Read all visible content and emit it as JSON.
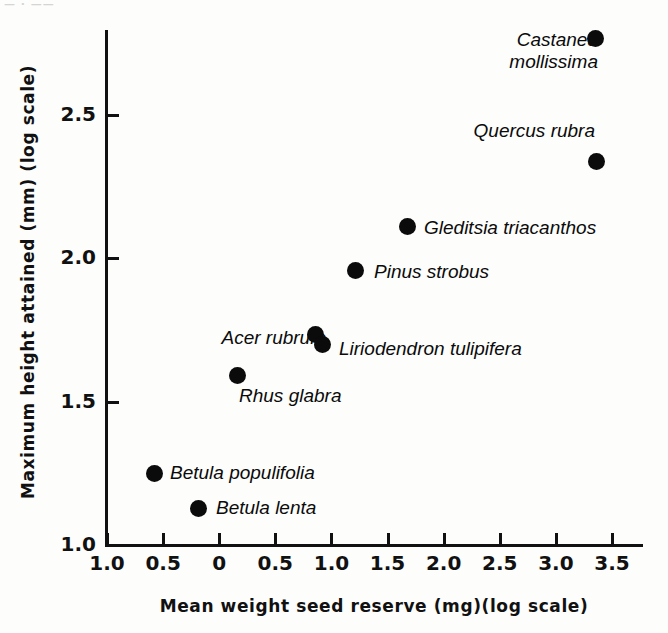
{
  "figure": {
    "page_header_remnant": "— · ——",
    "background_color": "#fdfdfc",
    "ink_color": "#0b0b0b"
  },
  "axes": {
    "y_title": "Maximum height attained (mm) (log scale)",
    "x_title": "Mean weight seed reserve (mg)(log scale)",
    "y_ticklabels": [
      "2.5",
      "2.0",
      "1.5",
      "1.0"
    ],
    "x_ticklabels": [
      "1.0",
      "0.5",
      "0",
      "0.5",
      "1.0",
      "1.5",
      "2.0",
      "2.5",
      "3.0",
      "3.5"
    ]
  },
  "chart_data": {
    "type": "scatter",
    "title": "",
    "xlabel": "Mean weight seed reserve (mg)(log scale)",
    "ylabel": "Maximum height attained (mm) (log scale)",
    "xlim": [
      -1.0,
      3.5
    ],
    "ylim": [
      1.0,
      2.81
    ],
    "xticks": [
      -1.0,
      -0.5,
      0,
      0.5,
      1.0,
      1.5,
      2.0,
      2.5,
      3.0,
      3.5
    ],
    "xticklabels": [
      "1.0",
      "0.5",
      "0",
      "0.5",
      "1.0",
      "1.5",
      "2.0",
      "2.5",
      "3.0",
      "3.5"
    ],
    "yticks": [
      1.0,
      1.5,
      2.0,
      2.5
    ],
    "yticklabels": [
      "1.0",
      "1.5",
      "2.0",
      "2.5"
    ],
    "grid": false,
    "legend": false,
    "marker": "filled-circle",
    "points": [
      {
        "label": "Castanea\nmollissima",
        "x": 3.36,
        "y": 2.78,
        "label_position": "left",
        "px": 595,
        "py": 38,
        "label_px": 458,
        "label_py": 29
      },
      {
        "label": "Quercus rubra",
        "x": 3.37,
        "y": 2.35,
        "label_position": "above-left",
        "px": 596,
        "py": 161,
        "label_px": 455,
        "label_py": 120
      },
      {
        "label": "Gleditsia triacanthos",
        "x": 1.68,
        "y": 2.12,
        "label_position": "right",
        "px": 407,
        "py": 226,
        "label_px": 424,
        "label_py": 217
      },
      {
        "label": "Pinus strobus",
        "x": 1.22,
        "y": 1.97,
        "label_position": "right",
        "px": 355,
        "py": 270,
        "label_px": 374,
        "label_py": 261
      },
      {
        "label": "Acer rubrum",
        "x": 0.86,
        "y": 1.74,
        "label_position": "left",
        "px": 315,
        "py": 334,
        "label_px": 186,
        "label_py": 327
      },
      {
        "label": "Liriodendron tulipifera",
        "x": 0.92,
        "y": 1.71,
        "label_position": "right",
        "px": 322,
        "py": 344,
        "label_px": 339,
        "label_py": 338
      },
      {
        "label": "Rhus glabra",
        "x": 0.16,
        "y": 1.6,
        "label_position": "below-right",
        "px": 237,
        "py": 375,
        "label_px": 239,
        "label_py": 385
      },
      {
        "label": "Betula populifolia",
        "x": -0.52,
        "y": 1.25,
        "label_position": "right",
        "px": 154,
        "py": 473,
        "label_px": 170,
        "label_py": 462
      },
      {
        "label": "Betula lenta",
        "x": -0.15,
        "y": 1.13,
        "label_position": "right",
        "px": 198,
        "py": 508,
        "label_px": 216,
        "label_py": 497
      }
    ]
  }
}
